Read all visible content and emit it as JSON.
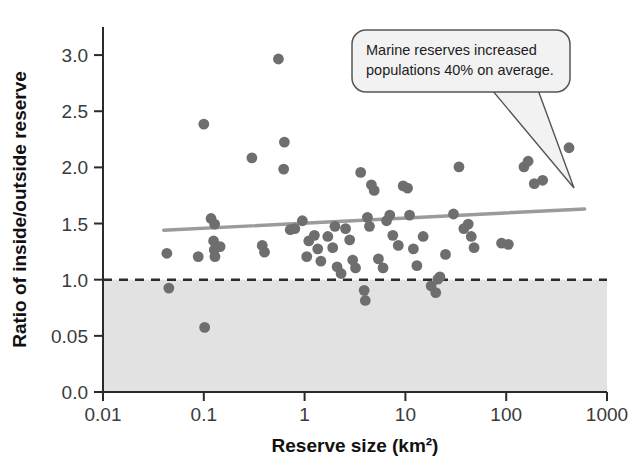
{
  "chart_data": {
    "type": "scatter",
    "title": "",
    "xlabel": "Reserve size (km²)",
    "ylabel": "Ratio of inside/outside reserve",
    "xscale": "log",
    "xlim": [
      0.01,
      1000
    ],
    "ylim": [
      0.0,
      3.25
    ],
    "xticks": [
      "0.01",
      "0.1",
      "1",
      "10",
      "100",
      "1000"
    ],
    "xtick_values": [
      0.01,
      0.1,
      1,
      10,
      100,
      1000
    ],
    "yticks": [
      "0.0",
      "0.05",
      "1.0",
      "1.5",
      "2.0",
      "2.5",
      "3.0"
    ],
    "ytick_values": [
      0.0,
      0.5,
      1.0,
      1.5,
      2.0,
      2.5,
      3.0
    ],
    "grid": false,
    "legend": null,
    "annotations": [
      {
        "name": "callout",
        "text_lines": [
          "Marine reserves increased",
          "populations 40% on average."
        ],
        "points_to": [
          0.62,
          0.26
        ]
      }
    ],
    "reference_line": {
      "name": "no-effect-line",
      "y": 1.0,
      "style": "dashed",
      "color": "#2b2b2b",
      "shaded_below": true,
      "shade_color": "#e2e2e2"
    },
    "trend_line": {
      "name": "regression-line",
      "color": "#9b9b9b",
      "x_start": 0.04,
      "y_start": 1.44,
      "x_end": 600,
      "y_end": 1.63
    },
    "marker": {
      "color": "#6e6e6e",
      "shape": "circle",
      "radius": 5.4
    },
    "points": [
      {
        "x": 0.043,
        "y": 1.235
      },
      {
        "x": 0.045,
        "y": 0.925
      },
      {
        "x": 0.088,
        "y": 1.205
      },
      {
        "x": 0.1,
        "y": 2.385
      },
      {
        "x": 0.102,
        "y": 0.575
      },
      {
        "x": 0.118,
        "y": 1.545
      },
      {
        "x": 0.128,
        "y": 1.495
      },
      {
        "x": 0.125,
        "y": 1.345
      },
      {
        "x": 0.127,
        "y": 1.265
      },
      {
        "x": 0.129,
        "y": 1.205
      },
      {
        "x": 0.145,
        "y": 1.295
      },
      {
        "x": 0.3,
        "y": 2.085
      },
      {
        "x": 0.38,
        "y": 1.305
      },
      {
        "x": 0.4,
        "y": 1.245
      },
      {
        "x": 0.55,
        "y": 2.965
      },
      {
        "x": 0.62,
        "y": 1.985
      },
      {
        "x": 0.63,
        "y": 2.225
      },
      {
        "x": 0.72,
        "y": 1.445
      },
      {
        "x": 0.8,
        "y": 1.455
      },
      {
        "x": 0.95,
        "y": 1.525
      },
      {
        "x": 1.05,
        "y": 1.205
      },
      {
        "x": 1.1,
        "y": 1.345
      },
      {
        "x": 1.25,
        "y": 1.395
      },
      {
        "x": 1.35,
        "y": 1.275
      },
      {
        "x": 1.45,
        "y": 1.165
      },
      {
        "x": 1.7,
        "y": 1.385
      },
      {
        "x": 1.9,
        "y": 1.285
      },
      {
        "x": 2.0,
        "y": 1.475
      },
      {
        "x": 2.1,
        "y": 1.115
      },
      {
        "x": 2.3,
        "y": 1.055
      },
      {
        "x": 2.55,
        "y": 1.455
      },
      {
        "x": 2.8,
        "y": 1.355
      },
      {
        "x": 3.0,
        "y": 1.175
      },
      {
        "x": 3.2,
        "y": 1.105
      },
      {
        "x": 3.6,
        "y": 1.955
      },
      {
        "x": 3.9,
        "y": 0.905
      },
      {
        "x": 4.0,
        "y": 0.815
      },
      {
        "x": 4.2,
        "y": 1.555
      },
      {
        "x": 4.4,
        "y": 1.475
      },
      {
        "x": 4.6,
        "y": 1.845
      },
      {
        "x": 4.9,
        "y": 1.795
      },
      {
        "x": 5.4,
        "y": 1.185
      },
      {
        "x": 6.0,
        "y": 1.105
      },
      {
        "x": 6.5,
        "y": 1.525
      },
      {
        "x": 7.0,
        "y": 1.575
      },
      {
        "x": 7.5,
        "y": 1.395
      },
      {
        "x": 8.5,
        "y": 1.305
      },
      {
        "x": 9.5,
        "y": 1.835
      },
      {
        "x": 10.5,
        "y": 1.815
      },
      {
        "x": 11.0,
        "y": 1.575
      },
      {
        "x": 12.0,
        "y": 1.275
      },
      {
        "x": 13.0,
        "y": 1.125
      },
      {
        "x": 15.0,
        "y": 1.385
      },
      {
        "x": 18.0,
        "y": 0.945
      },
      {
        "x": 20.0,
        "y": 0.885
      },
      {
        "x": 21.0,
        "y": 1.005
      },
      {
        "x": 22.0,
        "y": 1.025
      },
      {
        "x": 25.0,
        "y": 1.225
      },
      {
        "x": 30.0,
        "y": 1.585
      },
      {
        "x": 34.0,
        "y": 2.005
      },
      {
        "x": 38.0,
        "y": 1.455
      },
      {
        "x": 42.0,
        "y": 1.495
      },
      {
        "x": 45.0,
        "y": 1.385
      },
      {
        "x": 48.0,
        "y": 1.285
      },
      {
        "x": 90.0,
        "y": 1.325
      },
      {
        "x": 105.0,
        "y": 1.315
      },
      {
        "x": 150.0,
        "y": 2.005
      },
      {
        "x": 165.0,
        "y": 2.055
      },
      {
        "x": 190.0,
        "y": 1.855
      },
      {
        "x": 230.0,
        "y": 1.885
      },
      {
        "x": 420.0,
        "y": 2.175
      }
    ]
  }
}
